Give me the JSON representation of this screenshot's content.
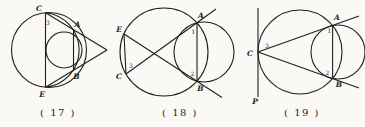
{
  "page": {
    "background": "#faf9f6",
    "ink_color": "#1f1f1f",
    "width": 365,
    "height": 127
  },
  "figures": [
    {
      "name": "figure-17",
      "offset_x": 5,
      "shapes": [
        {
          "kind": "circle",
          "name": "outer-circle",
          "cx": 44,
          "cy": 50,
          "r": 37.5
        },
        {
          "kind": "arc",
          "name": "inner-arc-CABE",
          "x1": 40.5,
          "y1": 12.7,
          "r": 37.5,
          "x2": 40.5,
          "y2": 87.3,
          "sweep": 1
        },
        {
          "kind": "circle",
          "name": "small-circle",
          "cx": 59,
          "cy": 50,
          "r": 18
        },
        {
          "kind": "line",
          "name": "chord-CE",
          "x1": 40.5,
          "y1": 12.7,
          "x2": 40.5,
          "y2": 87.3
        },
        {
          "kind": "line",
          "name": "line-C-vertex",
          "x1": 40.5,
          "y1": 12.7,
          "x2": 102,
          "y2": 50
        },
        {
          "kind": "line",
          "name": "line-E-vertex",
          "x1": 40.5,
          "y1": 87.3,
          "x2": 102,
          "y2": 50
        },
        {
          "kind": "line",
          "name": "chord-AB",
          "x1": 68.5,
          "y1": 29.7,
          "x2": 68.5,
          "y2": 70.3
        }
      ],
      "labels": [
        {
          "kind": "point",
          "text": "C",
          "x": 34,
          "y": 11
        },
        {
          "kind": "angle",
          "text": "3",
          "x": 43,
          "y": 24.5
        },
        {
          "kind": "point",
          "text": "A",
          "x": 72.5,
          "y": 26.5
        },
        {
          "kind": "point",
          "text": "B",
          "x": 71.5,
          "y": 78.5
        },
        {
          "kind": "point",
          "text": "E",
          "x": 37,
          "y": 97
        },
        {
          "kind": "caption",
          "text": "( 17 )",
          "x": 53,
          "y": 116
        }
      ]
    },
    {
      "name": "figure-18",
      "offset_x": 112,
      "shapes": [
        {
          "kind": "circle",
          "name": "left-circle",
          "cx": 52,
          "cy": 52,
          "r": 44
        },
        {
          "kind": "circle",
          "name": "right-circle",
          "cx": 92,
          "cy": 52,
          "r": 30
        },
        {
          "kind": "line",
          "name": "chord-EC",
          "x1": 12,
          "y1": 34,
          "x2": 14,
          "y2": 74
        },
        {
          "kind": "line",
          "name": "secant-C-A",
          "x1": 14,
          "y1": 74,
          "x2": 104,
          "y2": 9
        },
        {
          "kind": "line",
          "name": "secant-E-B",
          "x1": 12,
          "y1": 34,
          "x2": 110,
          "y2": 97.5
        },
        {
          "kind": "line",
          "name": "chord-AB",
          "x1": 85,
          "y1": 22.8,
          "x2": 85,
          "y2": 81.2
        }
      ],
      "labels": [
        {
          "kind": "point",
          "text": "E",
          "x": 7,
          "y": 32
        },
        {
          "kind": "point",
          "text": "C",
          "x": 7,
          "y": 79
        },
        {
          "kind": "angle",
          "text": "3",
          "x": 19,
          "y": 68
        },
        {
          "kind": "point",
          "text": "A",
          "x": 89,
          "y": 18
        },
        {
          "kind": "angle",
          "text": "1",
          "x": 81.5,
          "y": 34
        },
        {
          "kind": "angle",
          "text": "2",
          "x": 80.5,
          "y": 75.5
        },
        {
          "kind": "point",
          "text": "B",
          "x": 88.5,
          "y": 91
        },
        {
          "kind": "caption",
          "text": "( 18 )",
          "x": 68,
          "y": 116
        }
      ]
    },
    {
      "name": "figure-19",
      "offset_x": 245,
      "shapes": [
        {
          "kind": "circle",
          "name": "left-circle",
          "cx": 55,
          "cy": 52,
          "r": 42
        },
        {
          "kind": "circle",
          "name": "right-circle",
          "cx": 93,
          "cy": 52,
          "r": 27
        },
        {
          "kind": "line",
          "name": "tangent-line-P",
          "x1": 13,
          "y1": 8,
          "x2": 13,
          "y2": 97
        },
        {
          "kind": "line",
          "name": "secant-C-A",
          "x1": 13,
          "y1": 52,
          "x2": 114,
          "y2": 16
        },
        {
          "kind": "line",
          "name": "secant-C-B",
          "x1": 13,
          "y1": 52,
          "x2": 114,
          "y2": 88
        },
        {
          "kind": "line",
          "name": "chord-AB",
          "x1": 87.6,
          "y1": 25.5,
          "x2": 87.6,
          "y2": 78.5
        }
      ],
      "labels": [
        {
          "kind": "point",
          "text": "C",
          "x": 5,
          "y": 56
        },
        {
          "kind": "angle",
          "text": "3",
          "x": 22,
          "y": 48
        },
        {
          "kind": "point",
          "text": "A",
          "x": 92,
          "y": 20
        },
        {
          "kind": "angle",
          "text": "1",
          "x": 84.5,
          "y": 33
        },
        {
          "kind": "angle",
          "text": "2",
          "x": 82.5,
          "y": 74.5
        },
        {
          "kind": "point",
          "text": "B",
          "x": 94,
          "y": 87
        },
        {
          "kind": "point",
          "text": "P",
          "x": 10,
          "y": 104
        },
        {
          "kind": "caption",
          "text": "( 19 )",
          "x": 57,
          "y": 116
        }
      ]
    }
  ]
}
